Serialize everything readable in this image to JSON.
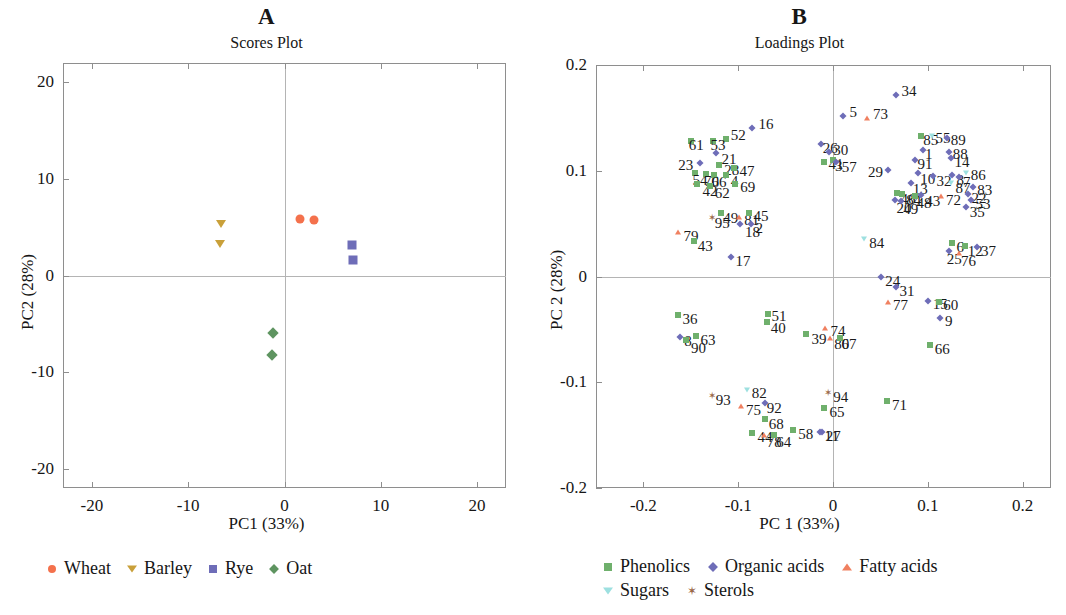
{
  "colors": {
    "wheat": "#F4714C",
    "barley": "#C9A03A",
    "rye": "#6E6DB8",
    "oat": "#5E9460",
    "phenolics": "#6FB06C",
    "organic_acids": "#6E6DB8",
    "fatty_acids": "#F08060",
    "sugars": "#9DE0E0",
    "sterols": "#9C6A4A",
    "axis": "#8e8e8e",
    "gridline": "#b4b4b4",
    "text": "#161616"
  },
  "panel_a": {
    "letter": "A",
    "subtitle": "Scores Plot",
    "xlabel": "PC1 (33%)",
    "ylabel": "PC2 (28%)",
    "xticks": [
      "-20",
      "-10",
      "0",
      "10",
      "20"
    ],
    "yticks": [
      "20",
      "10",
      "0",
      "-10",
      "-20"
    ],
    "legend": [
      {
        "label": "Wheat",
        "marker": "circle",
        "color": "#F4714C"
      },
      {
        "label": "Barley",
        "marker": "tri-down",
        "color": "#C9A03A"
      },
      {
        "label": "Rye",
        "marker": "square",
        "color": "#6E6DB8"
      },
      {
        "label": "Oat",
        "marker": "diamond",
        "color": "#5E9460"
      }
    ]
  },
  "panel_b": {
    "letter": "B",
    "subtitle": "Loadings Plot",
    "xlabel": "PC 1 (33%)",
    "ylabel": "PC 2 (28%)",
    "xticks": [
      "-0.2",
      "-0.1",
      "0",
      "0.1",
      "0.2"
    ],
    "yticks": [
      "0.2",
      "0.1",
      "0",
      "-0.1",
      "-0.2"
    ],
    "legend_row1": [
      {
        "label": "Phenolics",
        "marker": "square",
        "color": "#6FB06C"
      },
      {
        "label": "Organic acids",
        "marker": "diamond",
        "color": "#6E6DB8"
      },
      {
        "label": "Fatty acids",
        "marker": "tri-up",
        "color": "#F08060"
      }
    ],
    "legend_row2": [
      {
        "label": "Sugars",
        "marker": "tri-down",
        "color": "#9DE0E0"
      },
      {
        "label": "Sterols",
        "marker": "star",
        "color": "#9C6A4A"
      }
    ]
  },
  "chart_data": [
    {
      "type": "scatter",
      "title": "Scores Plot",
      "panel": "A",
      "xlabel": "PC1 (33%)",
      "ylabel": "PC2 (28%)",
      "xlim": [
        -23,
        23
      ],
      "ylim": [
        -22,
        22
      ],
      "xticks": [
        -20,
        -10,
        0,
        10,
        20
      ],
      "yticks": [
        -20,
        -10,
        0,
        10,
        20
      ],
      "grid": false,
      "legend_position": "bottom",
      "series": [
        {
          "name": "Wheat",
          "marker": "circle",
          "color": "#F4714C",
          "points": [
            [
              1.6,
              5.9
            ],
            [
              3.1,
              5.7
            ]
          ]
        },
        {
          "name": "Barley",
          "marker": "triangle-down",
          "color": "#C9A03A",
          "points": [
            [
              -6.6,
              5.3
            ],
            [
              -6.7,
              3.3
            ]
          ]
        },
        {
          "name": "Rye",
          "marker": "square",
          "color": "#6E6DB8",
          "points": [
            [
              7.0,
              3.2
            ],
            [
              7.1,
              1.6
            ]
          ]
        },
        {
          "name": "Oat",
          "marker": "diamond",
          "color": "#5E9460",
          "points": [
            [
              -1.2,
              -6.0
            ],
            [
              -1.3,
              -8.2
            ]
          ]
        }
      ]
    },
    {
      "type": "scatter",
      "title": "Loadings Plot",
      "panel": "B",
      "xlabel": "PC 1 (33%)",
      "ylabel": "PC 2 (28%)",
      "xlim": [
        -0.25,
        0.23
      ],
      "ylim": [
        -0.2,
        0.2
      ],
      "xticks": [
        -0.2,
        -0.1,
        0,
        0.1,
        0.2
      ],
      "yticks": [
        -0.2,
        -0.1,
        0,
        0.1,
        0.2
      ],
      "grid": false,
      "legend_position": "bottom",
      "groups": [
        {
          "name": "Phenolics",
          "marker": "square",
          "color": "#6FB06C"
        },
        {
          "name": "Organic acids",
          "marker": "diamond",
          "color": "#6E6DB8"
        },
        {
          "name": "Fatty acids",
          "marker": "triangle-up",
          "color": "#F08060"
        },
        {
          "name": "Sugars",
          "marker": "triangle-down",
          "color": "#9DE0E0"
        },
        {
          "name": "Sterols",
          "marker": "star",
          "color": "#9C6A4A"
        }
      ],
      "points": [
        {
          "id": "5",
          "x": 0.011,
          "y": 0.152,
          "g": "Organic acids",
          "lx": 6,
          "ly": -4
        },
        {
          "id": "73",
          "x": 0.036,
          "y": 0.15,
          "g": "Fatty acids",
          "lx": 6,
          "ly": -4
        },
        {
          "id": "34",
          "x": 0.066,
          "y": 0.172,
          "g": "Organic acids",
          "lx": 6,
          "ly": -4
        },
        {
          "id": "16",
          "x": -0.085,
          "y": 0.14,
          "g": "Organic acids",
          "lx": 6,
          "ly": -4
        },
        {
          "id": "52",
          "x": -0.113,
          "y": 0.13,
          "g": "Phenolics",
          "lx": 5,
          "ly": -4
        },
        {
          "id": "53",
          "x": -0.127,
          "y": 0.128,
          "g": "Phenolics",
          "lx": -2,
          "ly": 4
        },
        {
          "id": "61",
          "x": -0.15,
          "y": 0.128,
          "g": "Phenolics",
          "lx": -2,
          "ly": 4
        },
        {
          "id": "26",
          "x": -0.013,
          "y": 0.125,
          "g": "Organic acids",
          "lx": 2,
          "ly": 4
        },
        {
          "id": "85",
          "x": 0.093,
          "y": 0.133,
          "g": "Phenolics",
          "lx": 2,
          "ly": 4
        },
        {
          "id": "55",
          "x": 0.104,
          "y": 0.133,
          "g": "Sugars",
          "lx": 4,
          "ly": 2
        },
        {
          "id": "89",
          "x": 0.12,
          "y": 0.131,
          "g": "Organic acids",
          "lx": 4,
          "ly": 2
        },
        {
          "id": "21",
          "x": -0.123,
          "y": 0.117,
          "g": "Organic acids",
          "lx": 0,
          "ly": 6
        },
        {
          "id": "1",
          "x": 0.095,
          "y": 0.12,
          "g": "Organic acids",
          "lx": 2,
          "ly": 4
        },
        {
          "id": "88",
          "x": 0.122,
          "y": 0.118,
          "g": "Organic acids",
          "lx": 4,
          "ly": 2
        },
        {
          "id": "30",
          "x": -0.004,
          "y": 0.118,
          "g": "Organic acids",
          "lx": 4,
          "ly": -2
        },
        {
          "id": "41",
          "x": -0.01,
          "y": 0.108,
          "g": "Phenolics",
          "lx": 5,
          "ly": 2
        },
        {
          "id": "23",
          "x": -0.14,
          "y": 0.107,
          "g": "Organic acids",
          "lx": -22,
          "ly": 2
        },
        {
          "id": "28",
          "x": -0.12,
          "y": 0.105,
          "g": "Phenolics",
          "lx": 0,
          "ly": 5
        },
        {
          "id": "47",
          "x": -0.104,
          "y": 0.103,
          "g": "Phenolics",
          "lx": 5,
          "ly": 3
        },
        {
          "id": "91",
          "x": 0.087,
          "y": 0.11,
          "g": "Organic acids",
          "lx": 2,
          "ly": 4
        },
        {
          "id": "14",
          "x": 0.124,
          "y": 0.112,
          "g": "Organic acids",
          "lx": 4,
          "ly": 4
        },
        {
          "id": "3",
          "x": 0.0,
          "y": 0.11,
          "g": "Phenolics",
          "lx": 2,
          "ly": 6
        },
        {
          "id": "57",
          "x": 0.003,
          "y": 0.108,
          "g": "Organic acids",
          "lx": 6,
          "ly": 5
        },
        {
          "id": "29",
          "x": 0.058,
          "y": 0.101,
          "g": "Organic acids",
          "lx": -20,
          "ly": 2
        },
        {
          "id": "10",
          "x": 0.09,
          "y": 0.098,
          "g": "Organic acids",
          "lx": 2,
          "ly": 6
        },
        {
          "id": "32",
          "x": 0.105,
          "y": 0.095,
          "g": "Organic acids",
          "lx": 4,
          "ly": 5
        },
        {
          "id": "86",
          "x": 0.14,
          "y": 0.098,
          "g": "Sugars",
          "lx": 5,
          "ly": 2
        },
        {
          "id": "8",
          "x": 0.126,
          "y": 0.096,
          "g": "Organic acids",
          "lx": 4,
          "ly": 5
        },
        {
          "id": "7",
          "x": 0.133,
          "y": 0.094,
          "g": "Organic acids",
          "lx": 4,
          "ly": 5
        },
        {
          "id": "54",
          "x": -0.146,
          "y": 0.098,
          "g": "Phenolics",
          "lx": -2,
          "ly": 7
        },
        {
          "id": "70",
          "x": -0.134,
          "y": 0.097,
          "g": "Phenolics",
          "lx": -2,
          "ly": 7
        },
        {
          "id": "66",
          "x": -0.126,
          "y": 0.096,
          "g": "Phenolics",
          "lx": -2,
          "ly": 7
        },
        {
          "id": "4",
          "x": -0.113,
          "y": 0.096,
          "g": "Phenolics",
          "lx": 0,
          "ly": 6
        },
        {
          "id": "13",
          "x": 0.082,
          "y": 0.088,
          "g": "Organic acids",
          "lx": 2,
          "ly": 6
        },
        {
          "id": "87",
          "x": 0.125,
          "y": 0.088,
          "g": "Sugars",
          "lx": 4,
          "ly": 5
        },
        {
          "id": "83",
          "x": 0.148,
          "y": 0.085,
          "g": "Organic acids",
          "lx": 4,
          "ly": 3
        },
        {
          "id": "42",
          "x": -0.143,
          "y": 0.087,
          "g": "Phenolics",
          "lx": 0,
          "ly": 7
        },
        {
          "id": "62",
          "x": -0.13,
          "y": 0.086,
          "g": "Phenolics",
          "lx": 0,
          "ly": 7
        },
        {
          "id": "69",
          "x": -0.103,
          "y": 0.087,
          "g": "Phenolics",
          "lx": 5,
          "ly": 3
        },
        {
          "id": "46",
          "x": 0.068,
          "y": 0.079,
          "g": "Phenolics",
          "lx": 3,
          "ly": 6
        },
        {
          "id": "84",
          "x": 0.073,
          "y": 0.078,
          "g": "Phenolics",
          "lx": 4,
          "ly": 6
        },
        {
          "id": "48",
          "x": 0.086,
          "y": 0.076,
          "g": "Phenolics",
          "lx": 2,
          "ly": 7
        },
        {
          "id": "43",
          "x": 0.093,
          "y": 0.077,
          "g": "Organic acids",
          "lx": 4,
          "ly": 6
        },
        {
          "id": "72",
          "x": 0.114,
          "y": 0.076,
          "g": "Fatty acids",
          "lx": 5,
          "ly": 4
        },
        {
          "id": "22",
          "x": 0.142,
          "y": 0.078,
          "g": "Organic acids",
          "lx": 4,
          "ly": 4
        },
        {
          "id": "20",
          "x": 0.065,
          "y": 0.072,
          "g": "Organic acids",
          "lx": 2,
          "ly": 8
        },
        {
          "id": "49",
          "x": 0.072,
          "y": 0.071,
          "g": "Organic acids",
          "lx": 2,
          "ly": 8
        },
        {
          "id": "53b",
          "x": 0.146,
          "y": 0.072,
          "g": "Organic acids",
          "lx": 4,
          "ly": 4
        },
        {
          "id": "35",
          "x": 0.14,
          "y": 0.066,
          "g": "Organic acids",
          "lx": 4,
          "ly": 5
        },
        {
          "id": "95",
          "x": -0.128,
          "y": 0.055,
          "g": "Sterols",
          "lx": 3,
          "ly": 5
        },
        {
          "id": "49b",
          "x": -0.118,
          "y": 0.06,
          "g": "Phenolics",
          "lx": 2,
          "ly": 5
        },
        {
          "id": "81",
          "x": -0.099,
          "y": 0.056,
          "g": "Fatty acids",
          "lx": 5,
          "ly": 3
        },
        {
          "id": "45",
          "x": -0.089,
          "y": 0.06,
          "g": "Phenolics",
          "lx": 5,
          "ly": 3
        },
        {
          "id": "18",
          "x": -0.098,
          "y": 0.05,
          "g": "Organic acids",
          "lx": 0,
          "ly": 8
        },
        {
          "id": "2",
          "x": -0.087,
          "y": 0.05,
          "g": "Organic acids",
          "lx": 5,
          "ly": 4
        },
        {
          "id": "79",
          "x": -0.163,
          "y": 0.042,
          "g": "Fatty acids",
          "lx": 5,
          "ly": 4
        },
        {
          "id": "43b",
          "x": -0.147,
          "y": 0.034,
          "g": "Phenolics",
          "lx": 4,
          "ly": 5
        },
        {
          "id": "84b",
          "x": 0.033,
          "y": 0.035,
          "g": "Sugars",
          "lx": 5,
          "ly": 4
        },
        {
          "id": "6",
          "x": 0.126,
          "y": 0.032,
          "g": "Phenolics",
          "lx": 4,
          "ly": 4
        },
        {
          "id": "12",
          "x": 0.139,
          "y": 0.029,
          "g": "Phenolics",
          "lx": 3,
          "ly": 5
        },
        {
          "id": "37",
          "x": 0.152,
          "y": 0.028,
          "g": "Organic acids",
          "lx": 4,
          "ly": 4
        },
        {
          "id": "25",
          "x": 0.122,
          "y": 0.024,
          "g": "Organic acids",
          "lx": -2,
          "ly": 8
        },
        {
          "id": "76",
          "x": 0.133,
          "y": 0.022,
          "g": "Fatty acids",
          "lx": 2,
          "ly": 8
        },
        {
          "id": "17",
          "x": -0.108,
          "y": 0.018,
          "g": "Organic acids",
          "lx": 5,
          "ly": 4
        },
        {
          "id": "24",
          "x": 0.051,
          "y": 0.0,
          "g": "Organic acids",
          "lx": 4,
          "ly": 4
        },
        {
          "id": "31",
          "x": 0.066,
          "y": -0.01,
          "g": "Organic acids",
          "lx": 4,
          "ly": 4
        },
        {
          "id": "77",
          "x": 0.058,
          "y": -0.024,
          "g": "Fatty acids",
          "lx": 5,
          "ly": 3
        },
        {
          "id": "15",
          "x": 0.1,
          "y": -0.023,
          "g": "Organic acids",
          "lx": 5,
          "ly": 3
        },
        {
          "id": "60",
          "x": 0.112,
          "y": -0.024,
          "g": "Phenolics",
          "lx": 4,
          "ly": 3
        },
        {
          "id": "9",
          "x": 0.113,
          "y": -0.039,
          "g": "Organic acids",
          "lx": 5,
          "ly": 3
        },
        {
          "id": "51",
          "x": -0.069,
          "y": -0.035,
          "g": "Phenolics",
          "lx": 4,
          "ly": 2
        },
        {
          "id": "40",
          "x": -0.07,
          "y": -0.043,
          "g": "Phenolics",
          "lx": 4,
          "ly": 6
        },
        {
          "id": "36",
          "x": -0.164,
          "y": -0.036,
          "g": "Phenolics",
          "lx": 5,
          "ly": 4
        },
        {
          "id": "39",
          "x": -0.028,
          "y": -0.054,
          "g": "Phenolics",
          "lx": 5,
          "ly": 5
        },
        {
          "id": "74",
          "x": -0.008,
          "y": -0.049,
          "g": "Fatty acids",
          "lx": 5,
          "ly": 3
        },
        {
          "id": "80",
          "x": -0.003,
          "y": -0.058,
          "g": "Fatty acids",
          "lx": 4,
          "ly": 6
        },
        {
          "id": "67",
          "x": 0.007,
          "y": -0.058,
          "g": "Phenolics",
          "lx": 2,
          "ly": 6
        },
        {
          "id": "66b",
          "x": 0.102,
          "y": -0.065,
          "g": "Phenolics",
          "lx": 5,
          "ly": 4
        },
        {
          "id": "8b",
          "x": -0.161,
          "y": -0.057,
          "g": "Organic acids",
          "lx": 4,
          "ly": 4
        },
        {
          "id": "90",
          "x": -0.155,
          "y": -0.06,
          "g": "Phenolics",
          "lx": 0,
          "ly": 8
        },
        {
          "id": "63",
          "x": -0.145,
          "y": -0.056,
          "g": "Phenolics",
          "lx": 5,
          "ly": 4
        },
        {
          "id": "82",
          "x": -0.091,
          "y": -0.107,
          "g": "Sugars",
          "lx": 5,
          "ly": 3
        },
        {
          "id": "93",
          "x": -0.128,
          "y": -0.113,
          "g": "Sterols",
          "lx": 4,
          "ly": 4
        },
        {
          "id": "75",
          "x": -0.097,
          "y": -0.122,
          "g": "Fatty acids",
          "lx": 5,
          "ly": 4
        },
        {
          "id": "92",
          "x": -0.072,
          "y": -0.12,
          "g": "Organic acids",
          "lx": 2,
          "ly": 5
        },
        {
          "id": "94",
          "x": -0.005,
          "y": -0.11,
          "g": "Sterols",
          "lx": 5,
          "ly": 4
        },
        {
          "id": "65",
          "x": -0.009,
          "y": -0.124,
          "g": "Phenolics",
          "lx": 5,
          "ly": 4
        },
        {
          "id": "71",
          "x": 0.057,
          "y": -0.118,
          "g": "Phenolics",
          "lx": 5,
          "ly": 4
        },
        {
          "id": "68",
          "x": -0.072,
          "y": -0.135,
          "g": "Phenolics",
          "lx": 4,
          "ly": 5
        },
        {
          "id": "44",
          "x": -0.085,
          "y": -0.148,
          "g": "Phenolics",
          "lx": 5,
          "ly": 4
        },
        {
          "id": "78",
          "x": -0.073,
          "y": -0.15,
          "g": "Fatty acids",
          "lx": 3,
          "ly": 7
        },
        {
          "id": "64",
          "x": -0.062,
          "y": -0.15,
          "g": "Phenolics",
          "lx": 2,
          "ly": 7
        },
        {
          "id": "58",
          "x": -0.042,
          "y": -0.145,
          "g": "Phenolics",
          "lx": 5,
          "ly": 4
        },
        {
          "id": "11",
          "x": -0.012,
          "y": -0.147,
          "g": "Organic acids",
          "lx": 3,
          "ly": 4
        },
        {
          "id": "27",
          "x": -0.014,
          "y": -0.147,
          "g": "Organic acids",
          "lx": 6,
          "ly": 4
        }
      ]
    }
  ]
}
